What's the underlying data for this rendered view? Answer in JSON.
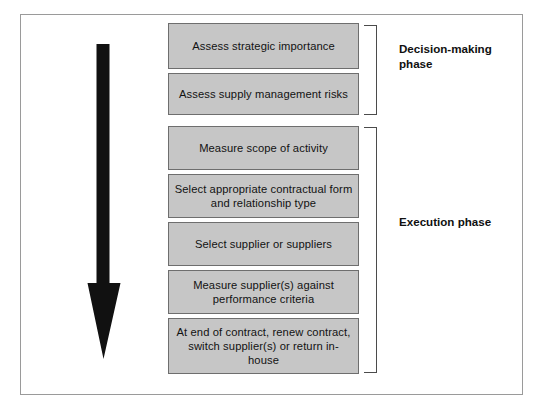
{
  "diagram": {
    "orientation": "vertical top-to-bottom",
    "flow_arrow": {
      "icon": "down-arrow-icon",
      "direction": "down",
      "color": "#111111"
    },
    "frame_color": "#9a9a9a",
    "box_fill": "#c6c6c6",
    "box_border": "#6e6e6e",
    "bracket_color": "#4b4b4b",
    "steps": [
      {
        "id": "step-1",
        "text": "Assess strategic importance"
      },
      {
        "id": "step-2",
        "text": "Assess supply management risks"
      },
      {
        "id": "step-3",
        "text": "Measure scope of activity"
      },
      {
        "id": "step-4",
        "text": "Select appropriate contractual form and relationship type"
      },
      {
        "id": "step-5",
        "text": "Select supplier or suppliers"
      },
      {
        "id": "step-6",
        "text": "Measure supplier(s) against performance criteria"
      },
      {
        "id": "step-7",
        "text": "At end of contract, renew contract, switch supplier(s) or return in-house"
      }
    ],
    "phases": [
      {
        "id": "phase-decision",
        "label": "Decision-making phase",
        "covers_steps": [
          "step-1",
          "step-2"
        ]
      },
      {
        "id": "phase-execution",
        "label": "Execution phase",
        "covers_steps": [
          "step-3",
          "step-4",
          "step-5",
          "step-6",
          "step-7"
        ]
      }
    ]
  }
}
